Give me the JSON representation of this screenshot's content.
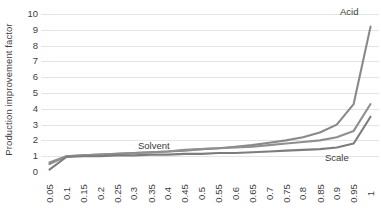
{
  "chart_data": {
    "type": "line",
    "title": "",
    "subtitle": "",
    "xlabel": "",
    "ylabel": "Production improvement factor",
    "ylim": [
      0,
      10
    ],
    "yticks": [
      0,
      1,
      2,
      3,
      4,
      5,
      6,
      7,
      8,
      9,
      10
    ],
    "grid": true,
    "legend_position": "inline-labels",
    "x": [
      0.05,
      0.1,
      0.15,
      0.2,
      0.25,
      0.3,
      0.35,
      0.4,
      0.45,
      0.5,
      0.55,
      0.6,
      0.65,
      0.7,
      0.75,
      0.8,
      0.85,
      0.9,
      0.95,
      1
    ],
    "categories": [
      "0.05",
      "0.1",
      "0.15",
      "0.2",
      "0.25",
      "0.3",
      "0.35",
      "0.4",
      "0.45",
      "0.5",
      "0.55",
      "0.6",
      "0.65",
      "0.7",
      "0.75",
      "0.8",
      "0.85",
      "0.9",
      "0.95",
      "1"
    ],
    "series": [
      {
        "name": "Acid",
        "color": "#898989",
        "values": [
          0.5,
          1.0,
          1.05,
          1.1,
          1.15,
          1.2,
          1.25,
          1.3,
          1.35,
          1.45,
          1.5,
          1.6,
          1.7,
          1.85,
          2.0,
          2.2,
          2.5,
          3.0,
          4.3,
          9.2
        ]
      },
      {
        "name": "Solvent",
        "color": "#8f8f8f",
        "values": [
          0.6,
          1.0,
          1.05,
          1.1,
          1.15,
          1.2,
          1.25,
          1.3,
          1.4,
          1.45,
          1.5,
          1.55,
          1.6,
          1.7,
          1.8,
          1.9,
          2.0,
          2.2,
          2.6,
          4.3
        ]
      },
      {
        "name": "Scale",
        "color": "#7d7d7d",
        "values": [
          0.15,
          0.95,
          1.0,
          1.0,
          1.05,
          1.05,
          1.1,
          1.1,
          1.15,
          1.15,
          1.2,
          1.2,
          1.25,
          1.3,
          1.35,
          1.4,
          1.45,
          1.55,
          1.8,
          3.5
        ]
      }
    ],
    "annotations": [
      {
        "text": "Acid",
        "x_px": 340,
        "y_px": 6
      },
      {
        "text": "Solvent",
        "x_px": 138,
        "y_px": 140
      },
      {
        "text": "Scale",
        "x_px": 325,
        "y_px": 152
      }
    ]
  },
  "colors": {
    "gridline": "#e4e4e4",
    "tick_text": "#404040",
    "background": "#ffffff"
  }
}
